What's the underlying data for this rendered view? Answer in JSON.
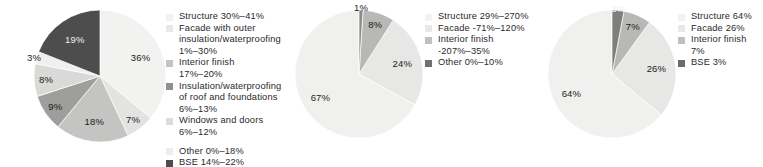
{
  "figure": {
    "type": "pie-chart-group",
    "count": 3,
    "background": "#ffffff"
  },
  "palette": {
    "structure": "#f2f2f0",
    "facade": "#e6e6e4",
    "interior": "#c9c9c7",
    "insulation_roof": "#a6a6a4",
    "windows_doors": "#dedede",
    "other": "#ededed",
    "bse": "#4d4d4d",
    "mid_other": "#6e6e6e",
    "text": "#1b1b1b"
  },
  "chart_data": [
    {
      "type": "pie",
      "title": "",
      "id": "chart-left",
      "legend_position": "right",
      "categories": [
        "Structure",
        "Facade with outer insulation/waterproofing",
        "Interior finish",
        "Insulation/waterproofing of roof and foundations",
        "Windows and doors",
        "Other",
        "BSE"
      ],
      "values": [
        36,
        7,
        18,
        9,
        8,
        3,
        19
      ],
      "data_labels": [
        "36%",
        "7%",
        "18%",
        "9%",
        "8%",
        "3%",
        "19%"
      ],
      "colors": [
        "#f2f2f0",
        "#e3e3e1",
        "#c4c4c2",
        "#9e9e9c",
        "#d9d9d7",
        "#efefef",
        "#4d4d4d"
      ],
      "legend": [
        {
          "swatch": "#f2f2f0",
          "lines": [
            "Structure 30%–41%"
          ],
          "gap_before": false
        },
        {
          "swatch": "#e8e8e6",
          "lines": [
            "Facade with outer",
            "insulation/waterproofing",
            "1%–30%"
          ],
          "gap_before": false
        },
        {
          "swatch": "#c4c4c2",
          "lines": [
            "Interior finish",
            "17%–20%"
          ],
          "gap_before": false
        },
        {
          "swatch": "#8f8f8d",
          "lines": [
            "Insulation/waterproofing",
            "of roof and foundations",
            "6%–13%"
          ],
          "gap_before": false
        },
        {
          "swatch": "#dcdcda",
          "lines": [
            "Windows and doors",
            "6%–12%"
          ],
          "gap_before": false
        },
        {
          "swatch": "#ededeb",
          "lines": [
            "Other 0%–18%"
          ],
          "gap_before": true
        },
        {
          "swatch": "#4d4d4d",
          "lines": [
            "BSE 14%–22%"
          ],
          "gap_before": false
        }
      ]
    },
    {
      "type": "pie",
      "title": "",
      "id": "chart-middle",
      "legend_position": "right",
      "categories": [
        "Structure",
        "Facade",
        "Interior finish",
        "Other"
      ],
      "values": [
        67,
        24,
        8,
        1
      ],
      "data_labels": [
        "67%",
        "24%",
        "8%",
        "1%"
      ],
      "colors": [
        "#f0f0ee",
        "#e7e7e5",
        "#b8b8b6",
        "#8a8a88"
      ],
      "legend": [
        {
          "swatch": "#f2f2f0",
          "lines": [
            "Structure 29%–270%"
          ],
          "gap_before": false
        },
        {
          "swatch": "#e8e8e6",
          "lines": [
            "Facade -71%–120%"
          ],
          "gap_before": false
        },
        {
          "swatch": "#c0c0be",
          "lines": [
            "Interior finish",
            "-207%–35%"
          ],
          "gap_before": false
        },
        {
          "swatch": "#707070",
          "lines": [
            "Other 0%–10%"
          ],
          "gap_before": false
        }
      ]
    },
    {
      "type": "pie",
      "title": "",
      "id": "chart-right",
      "legend_position": "right",
      "categories": [
        "Structure",
        "Facade",
        "Interior finish",
        "BSE"
      ],
      "values": [
        64,
        26,
        7,
        3
      ],
      "data_labels": [
        "64%",
        "26%",
        "7%",
        "3%"
      ],
      "colors": [
        "#f0f0ee",
        "#e7e7e5",
        "#b8b8b6",
        "#7e7e7c"
      ],
      "legend": [
        {
          "swatch": "#f2f2f0",
          "lines": [
            "Structure 64%"
          ],
          "gap_before": false
        },
        {
          "swatch": "#e8e8e6",
          "lines": [
            "Facade 26%"
          ],
          "gap_before": false
        },
        {
          "swatch": "#c0c0be",
          "lines": [
            "Interior finish",
            "7%"
          ],
          "gap_before": false
        },
        {
          "swatch": "#6b6b6b",
          "lines": [
            "BSE 3%"
          ],
          "gap_before": false
        }
      ]
    }
  ]
}
